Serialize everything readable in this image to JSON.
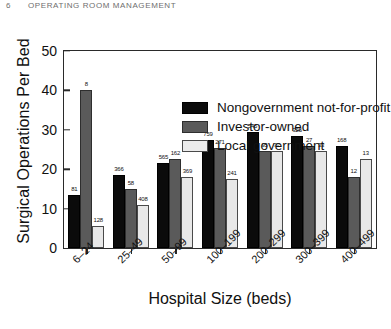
{
  "page_header": {
    "page_number": "6",
    "running_title": "OPERATING ROOM MANAGEMENT"
  },
  "chart_data": {
    "type": "bar",
    "title": "",
    "xlabel": "Hospital Size (beds)",
    "ylabel": "Surgical Operations Per Bed",
    "categories": [
      "6–24",
      "25–49",
      "50–99",
      "100–199",
      "200–299",
      "300–399",
      "400–499"
    ],
    "ylim": [
      0,
      50
    ],
    "yticks": [
      0,
      10,
      20,
      30,
      40,
      50
    ],
    "ytick_labels": [
      "0",
      "10",
      "20",
      "30",
      "40",
      "50"
    ],
    "grid": false,
    "legend_position": "upper center",
    "series": [
      {
        "name": "Nongovernment not-for-profit",
        "color": "#0b0b0b",
        "values": [
          13.5,
          18.5,
          21.5,
          27.5,
          29.5,
          28.5,
          26.0
        ],
        "point_labels": [
          "81",
          "366",
          "565",
          "759",
          "545",
          "325",
          "168"
        ]
      },
      {
        "name": "Investor-owned",
        "color": "#5a5a5a",
        "values": [
          40.0,
          15.0,
          22.5,
          25.5,
          24.5,
          26.0,
          18.0
        ],
        "point_labels": [
          "8",
          "58",
          "162",
          "271",
          "95",
          "27",
          "12"
        ]
      },
      {
        "name": "Local government",
        "color": "#e8e8e8",
        "values": [
          5.5,
          11.0,
          18.0,
          17.5,
          24.5,
          24.5,
          22.5
        ],
        "point_labels": [
          "128",
          "408",
          "369",
          "241",
          "72",
          "33",
          "13"
        ]
      }
    ]
  }
}
